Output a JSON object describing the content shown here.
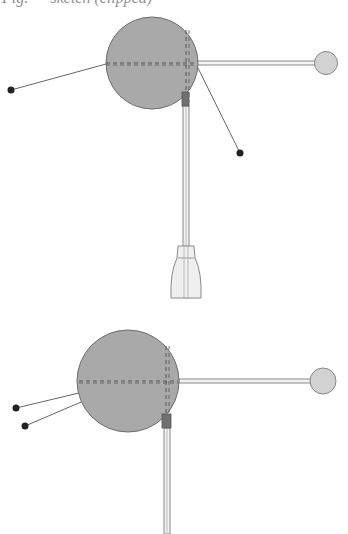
{
  "caption": {
    "text": "Fig. — sketch (clipped)"
  },
  "colors": {
    "background": "#ffffff",
    "body_fill": "#a9a9a9",
    "body_stroke": "#6e6e6e",
    "dash_stroke": "#555555",
    "rod_stroke": "#8a8a8a",
    "rod_fill": "#f2f2f2",
    "knob_fill": "#d2d2d2",
    "knob_stroke": "#888888",
    "block_fill": "#707070",
    "lead_stroke": "#666666",
    "dot_fill": "#222222",
    "bottle_fill": "#efefef",
    "bottle_stroke": "#8a8a8a"
  },
  "figures": [
    {
      "id": "figure-top",
      "body": {
        "cx": 152,
        "cy": 63,
        "r": 46
      },
      "dash_h": {
        "x1": 106,
        "y1": 63,
        "x2": 197,
        "y2": 63
      },
      "dash_v": {
        "x1": 186,
        "y1": 30,
        "x2": 186,
        "y2": 102
      },
      "rod_h": {
        "x": 197,
        "y": 61,
        "w": 118,
        "h": 4
      },
      "knob": {
        "cx": 326,
        "cy": 63,
        "r": 11.5
      },
      "block": {
        "x": 182,
        "y": 92,
        "w": 7,
        "h": 14
      },
      "rod_v": {
        "x": 183,
        "y": 106,
        "w": 6,
        "h": 142
      },
      "bottle": true,
      "leads": [
        {
          "x1": 106,
          "y1": 64,
          "x2": 11,
          "y2": 90
        },
        {
          "x1": 197,
          "y1": 66,
          "x2": 240,
          "y2": 153
        }
      ]
    },
    {
      "id": "figure-bottom",
      "body": {
        "cx": 128,
        "cy": 381,
        "r": 51
      },
      "dash_h": {
        "x1": 79,
        "y1": 381,
        "x2": 178,
        "y2": 381
      },
      "dash_v": {
        "x1": 166,
        "y1": 346,
        "x2": 166,
        "y2": 418
      },
      "rod_h": {
        "x": 179,
        "y": 379,
        "w": 132,
        "h": 4
      },
      "knob": {
        "cx": 323,
        "cy": 381,
        "r": 13
      },
      "block": {
        "x": 162,
        "y": 414,
        "w": 9,
        "h": 14
      },
      "rod_v": {
        "x": 164,
        "y": 428,
        "w": 6,
        "h": 106
      },
      "bottle": false,
      "leads": [
        {
          "x1": 79,
          "y1": 393,
          "x2": 16,
          "y2": 408
        },
        {
          "x1": 128,
          "y1": 382,
          "x2": 25,
          "y2": 426
        }
      ]
    }
  ]
}
